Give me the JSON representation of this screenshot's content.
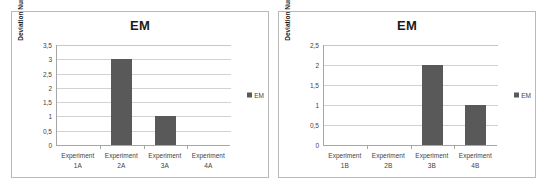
{
  "figure": {
    "background": "#ffffff",
    "panel_border_color": "#b9b9b9",
    "bar_color": "#595959",
    "gridline_color": "#d2d2d2",
    "axis_color": "#a6a6a6"
  },
  "charts": [
    {
      "panel_name": "chart-panel-a",
      "title": "EM",
      "ylabel": "Deviation Number",
      "legend": {
        "label": "EM",
        "position": "right",
        "swatch_color": "#595959"
      },
      "yticks": [
        "0",
        "0,5",
        "1",
        "1,5",
        "2",
        "2,5",
        "3",
        "3,5"
      ],
      "categories": [
        {
          "line1": "Experiment",
          "line2": "1A"
        },
        {
          "line1": "Experiment",
          "line2": "2A"
        },
        {
          "line1": "Experiment",
          "line2": "3A"
        },
        {
          "line1": "Experiment",
          "line2": "4A"
        }
      ]
    },
    {
      "panel_name": "chart-panel-b",
      "title": "EM",
      "ylabel": "Deviation Number",
      "legend": {
        "label": "EM",
        "position": "right",
        "swatch_color": "#595959"
      },
      "yticks": [
        "0",
        "0,5",
        "1",
        "1,5",
        "2",
        "2,5"
      ],
      "categories": [
        {
          "line1": "Experiment",
          "line2": "1B"
        },
        {
          "line1": "Experiment",
          "line2": "2B"
        },
        {
          "line1": "Experiment",
          "line2": "3B"
        },
        {
          "line1": "Experiment",
          "line2": "4B"
        }
      ]
    }
  ],
  "chart_data": [
    {
      "type": "bar",
      "title": "EM",
      "xlabel": "",
      "ylabel": "Deviation Number",
      "categories": [
        "Experiment 1A",
        "Experiment 2A",
        "Experiment 3A",
        "Experiment 4A"
      ],
      "series": [
        {
          "name": "EM",
          "values": [
            0,
            3,
            1,
            0
          ],
          "color": "#595959"
        }
      ],
      "values": [
        0,
        3,
        1,
        0
      ],
      "ylim": [
        0,
        3.5
      ],
      "ytick_step": 0.5,
      "ytick_labels": [
        "0",
        "0,5",
        "1",
        "1,5",
        "2",
        "2,5",
        "3",
        "3,5"
      ],
      "grid": true,
      "grid_axis": "y",
      "legend": "EM",
      "legend_position": "right",
      "decimal_separator": ","
    },
    {
      "type": "bar",
      "title": "EM",
      "xlabel": "",
      "ylabel": "Deviation Number",
      "categories": [
        "Experiment 1B",
        "Experiment 2B",
        "Experiment 3B",
        "Experiment 4B"
      ],
      "series": [
        {
          "name": "EM",
          "values": [
            0,
            0,
            2,
            1
          ],
          "color": "#595959"
        }
      ],
      "values": [
        0,
        0,
        2,
        1
      ],
      "ylim": [
        0,
        2.5
      ],
      "ytick_step": 0.5,
      "ytick_labels": [
        "0",
        "0,5",
        "1",
        "1,5",
        "2",
        "2,5"
      ],
      "grid": true,
      "grid_axis": "y",
      "legend": "EM",
      "legend_position": "right",
      "decimal_separator": ","
    }
  ]
}
